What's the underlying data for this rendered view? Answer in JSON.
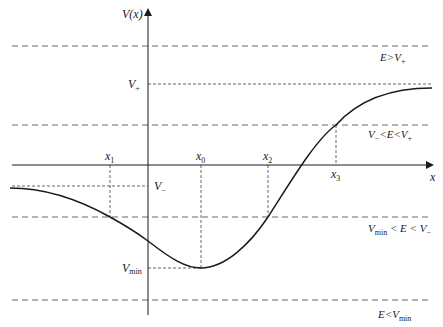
{
  "diagram": {
    "type": "potential-energy-curve",
    "axes": {
      "y_label": "V(x)",
      "x_label": "x"
    },
    "energy_levels": [
      {
        "id": "e-above-vplus",
        "label": "E>V",
        "sub": "+",
        "y": 46
      },
      {
        "id": "vplus-level",
        "label": "V",
        "sub": "+",
        "y": 84,
        "axis_label": true
      },
      {
        "id": "vminus-lt-e-lt-vplus",
        "label": "V",
        "sub": "−",
        "mid": "<E<V",
        "sub2": "+",
        "y": 125
      },
      {
        "id": "vminus-level",
        "label": "V",
        "sub": "−",
        "y": 186,
        "axis_label": true
      },
      {
        "id": "vmin-lt-e-lt-vminus",
        "label": "V",
        "sub": "min",
        "mid": " < E < V",
        "sub2": "−",
        "y": 217
      },
      {
        "id": "vmin-level",
        "label": "V",
        "sub": "min",
        "y": 268,
        "axis_label": true
      },
      {
        "id": "e-below-vmin",
        "label": "E<V",
        "sub": "min",
        "y": 300
      }
    ],
    "turning_points": [
      {
        "label": "x",
        "sub": "1",
        "x": 110
      },
      {
        "label": "x",
        "sub": "0",
        "x": 201
      },
      {
        "label": "x",
        "sub": "2",
        "x": 268
      },
      {
        "label": "x",
        "sub": "3",
        "x": 336
      }
    ],
    "labels": {
      "y_axis": "V(x)",
      "x_axis": "x",
      "v_plus": "V",
      "v_plus_sub": "+",
      "v_minus": "V",
      "v_minus_sub": "−",
      "v_min": "V",
      "v_min_sub": "min",
      "e_gt_vplus": "E>V",
      "e_gt_vplus_sub": "+",
      "vm_e_vp_a": "V",
      "vm_e_vp_a_sub": "−",
      "vm_e_vp_mid": "<E<V",
      "vm_e_vp_b_sub": "+",
      "vmin_e_vm_a": "V",
      "vmin_e_vm_a_sub": "min",
      "vmin_e_vm_mid": " < E < V",
      "vmin_e_vm_b_sub": "−",
      "e_lt_vmin": "E<V",
      "e_lt_vmin_sub": "min",
      "x1": "x",
      "x1_sub": "1",
      "x0": "x",
      "x0_sub": "0",
      "x2": "x",
      "x2_sub": "2",
      "x3": "x",
      "x3_sub": "3"
    },
    "colors": {
      "curve": "#1a1a1a",
      "axis": "#1a1a1a",
      "dashed": "#555555"
    }
  }
}
